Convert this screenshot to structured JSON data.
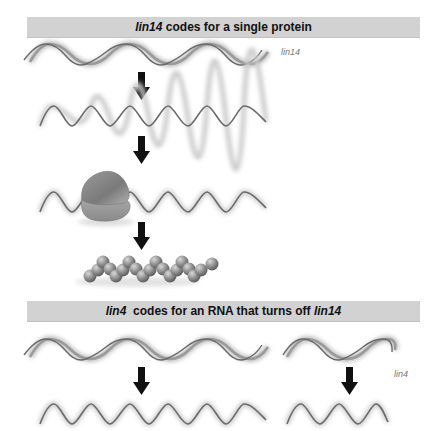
{
  "panel_top": {
    "title_gene": "lin14",
    "title_rest": " codes for a single protein",
    "gene_label": "lin14",
    "steps": [
      "DNA double helix (lin14 gene)",
      "mRNA transcript",
      "Ribosome translating mRNA",
      "Protein chain"
    ]
  },
  "panel_bottom": {
    "title_gene": "lin4",
    "title_middle": "  codes for an RNA that turns off ",
    "title_target": "lin14",
    "gene_label": "lin4",
    "left_steps": [
      "DNA double helix (lin14 gene)",
      "mRNA transcript"
    ],
    "right_steps": [
      "DNA double helix (lin4 gene)",
      "small RNA transcript"
    ]
  },
  "colors": {
    "header_bg": "#d2d2d2",
    "strand": "#6a6a6a",
    "arrow": "#111111",
    "ribosome": "#8a8a8a",
    "bead": "#8c8c8c"
  }
}
